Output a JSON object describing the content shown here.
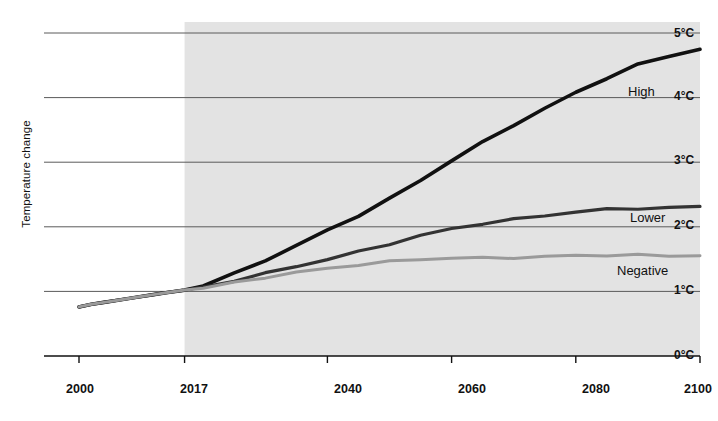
{
  "chart_data": {
    "type": "line",
    "title": "",
    "xlabel": "",
    "ylabel": "Temperature change",
    "xlim": [
      2000,
      2100
    ],
    "ylim": [
      0,
      5
    ],
    "grid": true,
    "legend_position": "inline-right",
    "x_ticks": [
      "2000",
      "2017",
      "2040",
      "2060",
      "2080",
      "2100"
    ],
    "x_tick_values": [
      2000,
      2017,
      2040,
      2060,
      2080,
      2100
    ],
    "y_ticks": [
      "0°C",
      "1°C",
      "2°C",
      "3°C",
      "4°C",
      "5°C"
    ],
    "y_tick_values": [
      0,
      1,
      2,
      3,
      4,
      5
    ],
    "projection_shading": {
      "label": "",
      "from": 2017,
      "to": 2100,
      "color": "#e3e3e3"
    },
    "x": [
      2000,
      2002,
      2004,
      2006,
      2008,
      2010,
      2012,
      2014,
      2017,
      2020,
      2025,
      2030,
      2035,
      2040,
      2045,
      2050,
      2055,
      2060,
      2065,
      2070,
      2075,
      2080,
      2085,
      2090,
      2095,
      2100
    ],
    "series": [
      {
        "name": "High",
        "label": "High",
        "color": "#111111",
        "width": 3.6,
        "values": [
          0.76,
          0.8,
          0.83,
          0.86,
          0.89,
          0.92,
          0.95,
          0.98,
          1.02,
          1.1,
          1.28,
          1.48,
          1.7,
          1.94,
          2.18,
          2.44,
          2.72,
          3.02,
          3.3,
          3.58,
          3.84,
          4.08,
          4.3,
          4.5,
          4.64,
          4.76
        ]
      },
      {
        "name": "Lower",
        "label": "Lower",
        "color": "#333333",
        "width": 3.2,
        "values": [
          0.76,
          0.8,
          0.83,
          0.86,
          0.89,
          0.92,
          0.95,
          0.98,
          1.02,
          1.07,
          1.17,
          1.27,
          1.38,
          1.5,
          1.62,
          1.74,
          1.86,
          1.96,
          2.05,
          2.12,
          2.18,
          2.23,
          2.26,
          2.28,
          2.3,
          2.32
        ]
      },
      {
        "name": "Negative",
        "label": "Negative",
        "color": "#9a9a9a",
        "width": 3.0,
        "values": [
          0.76,
          0.8,
          0.83,
          0.86,
          0.89,
          0.92,
          0.95,
          0.98,
          1.02,
          1.06,
          1.13,
          1.21,
          1.29,
          1.36,
          1.42,
          1.46,
          1.49,
          1.51,
          1.52,
          1.53,
          1.54,
          1.55,
          1.55,
          1.56,
          1.56,
          1.56
        ]
      }
    ],
    "series_label_positions": [
      {
        "name": "High",
        "x_px": 628,
        "y_px": 92
      },
      {
        "name": "Lower",
        "x_px": 630,
        "y_px": 218
      },
      {
        "name": "Negative",
        "x_px": 617,
        "y_px": 271
      }
    ]
  }
}
